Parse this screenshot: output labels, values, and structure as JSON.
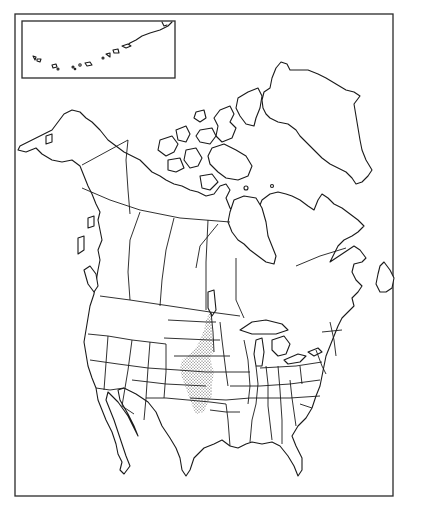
{
  "map": {
    "title": "",
    "type": "outline range map",
    "region": "North America",
    "colors": {
      "background": "#ffffff",
      "outline": "#1a1a1a",
      "range_stipple": "#333333"
    },
    "inset": {
      "label": "",
      "depicts": "Aleutian Islands / Alaska Peninsula"
    },
    "range": {
      "label": "",
      "style": "stippled dots",
      "extent": "Great Plains: southern Saskatchewan/Manitoba border south through Dakotas, Nebraska, Kansas, western Oklahoma to northern Texas"
    }
  }
}
